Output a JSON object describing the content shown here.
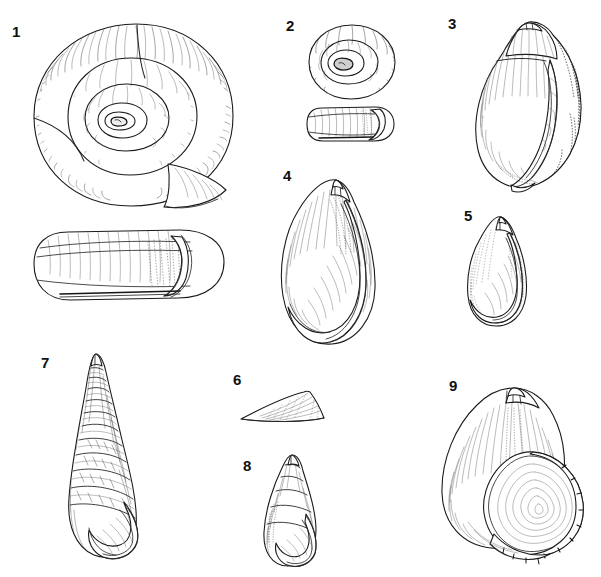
{
  "plate": {
    "kind": "scientific-illustration-plate",
    "background_color": "#ffffff",
    "ink_color": "#1b1b1b",
    "width": 601,
    "height": 577,
    "technique": "pen-and-ink stipple and line hatching",
    "subject": "gastropod (snail) shells",
    "figure_count": 9
  },
  "figures": [
    {
      "number": "1",
      "label_x": 12,
      "label_y": 24,
      "views": 2,
      "view_names": [
        "apical-spiral-view",
        "lateral-view"
      ],
      "shell_form": "planispiral flat-coiled discoid shell",
      "whorls": "about 4 rapidly expanding whorls",
      "box": {
        "x": 18,
        "y": 18,
        "width": 230,
        "height": 290
      },
      "description": "Largest figure: flattened disc-shaped shell seen from above with a deeply impressed spiral, plus a cylindrical lateral view below showing the aperture"
    },
    {
      "number": "2",
      "label_x": 286,
      "label_y": 18,
      "views": 2,
      "view_names": [
        "apical-spiral-view",
        "lateral-view"
      ],
      "shell_form": "small planispiral discoid shell",
      "whorls": "about 3 whorls",
      "box": {
        "x": 300,
        "y": 22,
        "width": 100,
        "height": 125
      },
      "description": "Small flat coiled shell from above with tight central spiral, plus a short cylindrical side view below"
    },
    {
      "number": "3",
      "label_x": 448,
      "label_y": 16,
      "views": 1,
      "view_names": [
        "apertural-view"
      ],
      "shell_form": "globose ovate shell with short spire and large body whorl",
      "whorls": "about 4 whorls",
      "box": {
        "x": 470,
        "y": 20,
        "width": 115,
        "height": 170
      },
      "description": "Rounded egg-shaped shell with a broad aperture and heavily stippled shading on the right flank"
    },
    {
      "number": "4",
      "label_x": 283,
      "label_y": 168,
      "views": 1,
      "view_names": [
        "apertural-view"
      ],
      "shell_form": "elongate ovate shell, tall body whorl, small pointed spire",
      "whorls": "about 4 whorls",
      "box": {
        "x": 272,
        "y": 175,
        "width": 110,
        "height": 170
      },
      "description": "Tall oval shell with a narrow pointed apex and a long tapering aperture covering most of the front"
    },
    {
      "number": "5",
      "label_x": 464,
      "label_y": 208,
      "views": 1,
      "view_names": [
        "apertural-view"
      ],
      "shell_form": "small ovate shell with blunt apex",
      "whorls": "about 3 whorls",
      "box": {
        "x": 462,
        "y": 215,
        "width": 70,
        "height": 112
      },
      "description": "Small smooth oval shell with a lightly stippled surface and simple oval aperture"
    },
    {
      "number": "6",
      "label_x": 233,
      "label_y": 372,
      "views": 1,
      "view_names": [
        "lateral-view"
      ],
      "shell_form": "limpet-like low conical cap shell",
      "whorls": "no visible coiling",
      "box": {
        "x": 236,
        "y": 388,
        "width": 95,
        "height": 40
      },
      "description": "Low triangular cap-shaped shell drawn in side profile with fine concentric growth lines"
    },
    {
      "number": "7",
      "label_x": 41,
      "label_y": 355,
      "views": 1,
      "view_names": [
        "apertural-view"
      ],
      "shell_form": "high-spired turreted shell with strong spiral cords",
      "whorls": "about 9 whorls",
      "box": {
        "x": 58,
        "y": 356,
        "width": 100,
        "height": 205
      },
      "description": "Tall slender tower-shaped shell with sharply pointed apex, ribbed sculpture and an oval aperture at the base"
    },
    {
      "number": "8",
      "label_x": 243,
      "label_y": 458,
      "views": 1,
      "view_names": [
        "apertural-view"
      ],
      "shell_form": "conical ovate shell with stepped whorls",
      "whorls": "about 5 whorls",
      "box": {
        "x": 258,
        "y": 455,
        "width": 70,
        "height": 115
      },
      "description": "Small cone-shaped shell with clearly stepped whorls and a rounded aperture at the lower right"
    },
    {
      "number": "9",
      "label_x": 449,
      "label_y": 378,
      "views": 1,
      "view_names": [
        "apertural-view"
      ],
      "shell_form": "globose shell with very large flaring aperture and thickened lip",
      "whorls": "about 4 whorls",
      "box": {
        "x": 438,
        "y": 382,
        "width": 150,
        "height": 180
      },
      "description": "Broad rounded shell tilted to show an enormous oval aperture bounded by a thick beaded outer lip"
    }
  ]
}
